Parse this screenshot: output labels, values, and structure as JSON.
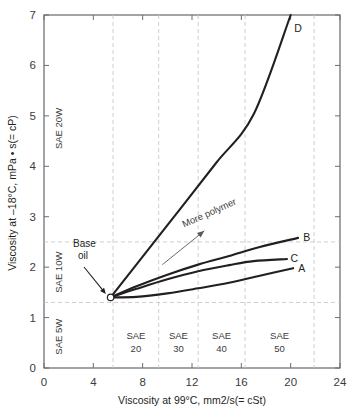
{
  "chart_data": {
    "type": "line",
    "title": "",
    "xlabel": "Viscosity at 99°C, mm2/s(= cSt)",
    "ylabel": "Viscosity at –18°C, mPa • s(= cP)",
    "xlim": [
      0,
      24
    ],
    "ylim": [
      0,
      7
    ],
    "xticks": [
      0,
      4,
      8,
      12,
      16,
      20,
      24
    ],
    "xticklabels": [
      "0",
      "4",
      "8",
      "12",
      "16",
      "20",
      "24"
    ],
    "yticks": [
      0,
      1,
      2,
      3,
      4,
      5,
      6,
      7
    ],
    "yticklabels": [
      "0",
      "1",
      "2",
      "3",
      "4",
      "5",
      "6",
      "7"
    ],
    "grid": "dashed-bands-only",
    "legend": "inline-endpoint-labels",
    "base_point": {
      "label": "Base oil",
      "x": 5.4,
      "y": 1.4
    },
    "vertical_band_lines": [
      5.6,
      9.3,
      12.5,
      16.3,
      21.9
    ],
    "horizontal_band_lines": [
      1.3,
      2.5
    ],
    "series": [
      {
        "name": "A",
        "label": "A",
        "label_x": 20.9,
        "label_y": 1.98,
        "points": [
          [
            5.4,
            1.4
          ],
          [
            7.5,
            1.41
          ],
          [
            10.0,
            1.48
          ],
          [
            12.5,
            1.58
          ],
          [
            15.0,
            1.69
          ],
          [
            17.5,
            1.83
          ],
          [
            20.2,
            1.98
          ]
        ]
      },
      {
        "name": "B",
        "label": "B",
        "label_x": 21.3,
        "label_y": 2.6,
        "points": [
          [
            5.4,
            1.4
          ],
          [
            7.5,
            1.62
          ],
          [
            10.0,
            1.85
          ],
          [
            12.5,
            2.05
          ],
          [
            15.0,
            2.22
          ],
          [
            17.5,
            2.4
          ],
          [
            20.6,
            2.58
          ]
        ]
      },
      {
        "name": "C",
        "label": "C",
        "label_x": 20.3,
        "label_y": 2.18,
        "points": [
          [
            5.4,
            1.4
          ],
          [
            7.5,
            1.57
          ],
          [
            10.0,
            1.76
          ],
          [
            12.5,
            1.92
          ],
          [
            15.0,
            2.04
          ],
          [
            17.0,
            2.12
          ],
          [
            19.7,
            2.16
          ]
        ]
      },
      {
        "name": "D",
        "label": "D",
        "label_x": 20.6,
        "label_y": 6.75,
        "points": [
          [
            5.4,
            1.4
          ],
          [
            8.0,
            2.21
          ],
          [
            11.0,
            3.14
          ],
          [
            14.0,
            4.08
          ],
          [
            17.0,
            5.03
          ],
          [
            20.0,
            7.0
          ]
        ]
      }
    ],
    "annotations": [
      {
        "name": "more-polymer",
        "text": "More polymer",
        "text_x": 13.5,
        "text_y": 3.02,
        "rotation": -24,
        "arrow_from": [
          9.6,
          2.05
        ],
        "arrow_to": [
          13.0,
          2.72
        ]
      }
    ],
    "bands": {
      "left_vertical": [
        {
          "name": "sae-20w",
          "text": "SAE 20W",
          "y_center": 4.75
        },
        {
          "name": "sae-10w",
          "text": "SAE 10W",
          "y_center": 1.9
        },
        {
          "name": "sae-5w",
          "text": "SAE 5W",
          "y_center": 0.62
        }
      ],
      "bottom_horizontal": [
        {
          "name": "sae-20",
          "line1": "SAE",
          "line2": "20",
          "x_center": 7.45
        },
        {
          "name": "sae-30",
          "line1": "SAE",
          "line2": "30",
          "x_center": 10.9
        },
        {
          "name": "sae-40",
          "line1": "SAE",
          "line2": "40",
          "x_center": 14.4
        },
        {
          "name": "sae-50",
          "line1": "SAE",
          "line2": "50",
          "x_center": 19.1
        }
      ]
    },
    "colors": {
      "curve": "#231f20",
      "grid": "#c7c8ca",
      "axis": "#58595b",
      "text": "#231f20",
      "background": "#ffffff"
    }
  }
}
